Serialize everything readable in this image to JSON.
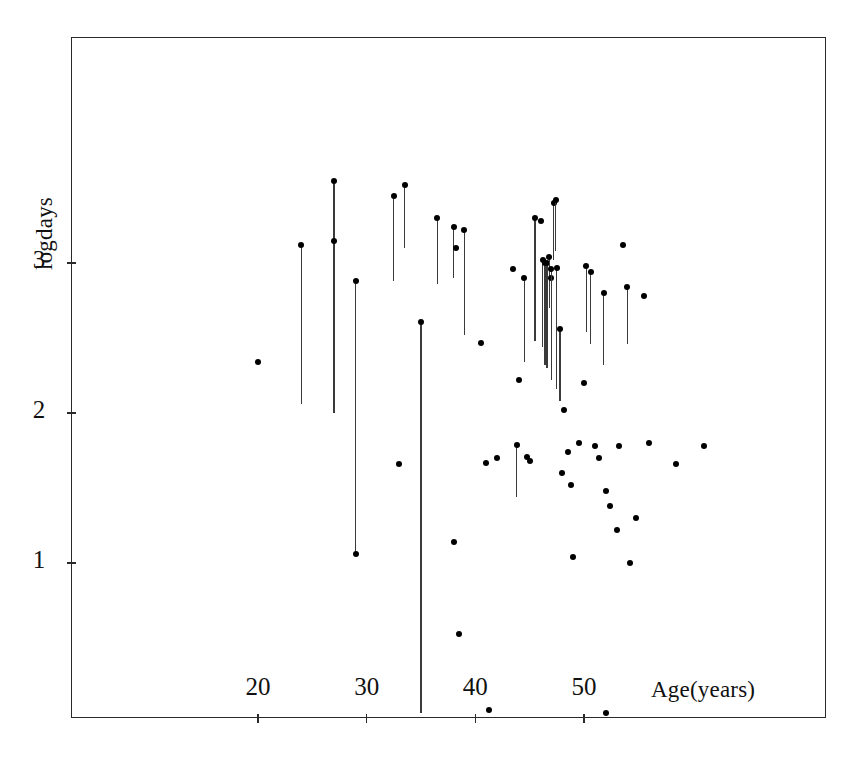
{
  "figure": {
    "kind": "scatter-with-dropline",
    "background": "#ffffff",
    "ink": "#111111"
  },
  "chart_data": {
    "type": "scatter",
    "title": "",
    "subtitle": "",
    "xlabel": "Age(years)",
    "ylabel": "logdays",
    "xlim": [
      15.1,
      84.4
    ],
    "ylim": [
      -0.03,
      4.54
    ],
    "grid": false,
    "legend": null,
    "annotations": [],
    "xticks": [
      20,
      30,
      40,
      50
    ],
    "xticklabels": [
      "20",
      "30",
      "40",
      "50"
    ],
    "yticks": [
      1,
      2,
      3
    ],
    "yticklabels": [
      "1",
      "2",
      "3"
    ],
    "marker": "filled-circle",
    "points": [
      {
        "x": 20.0,
        "y": 2.34
      },
      {
        "x": 24.0,
        "y": 3.12,
        "low": 2.06
      },
      {
        "x": 27.0,
        "y": 3.55,
        "low": 2.55
      },
      {
        "x": 27.0,
        "y": 3.15,
        "low": 2.0
      },
      {
        "x": 29.0,
        "y": 2.88,
        "low": 1.06,
        "low_dot": true
      },
      {
        "x": 32.5,
        "y": 3.45,
        "low": 2.88
      },
      {
        "x": 33.5,
        "y": 3.52,
        "low": 3.1
      },
      {
        "x": 33.0,
        "y": 1.66
      },
      {
        "x": 35.0,
        "y": 2.61,
        "low": 0.0
      },
      {
        "x": 36.5,
        "y": 3.3,
        "low": 2.86
      },
      {
        "x": 38.0,
        "y": 3.24,
        "low": 2.9
      },
      {
        "x": 39.0,
        "y": 3.22,
        "low": 2.52
      },
      {
        "x": 38.2,
        "y": 3.1
      },
      {
        "x": 38.0,
        "y": 1.14
      },
      {
        "x": 38.5,
        "y": 0.53
      },
      {
        "x": 40.5,
        "y": 2.47
      },
      {
        "x": 41.0,
        "y": 1.67
      },
      {
        "x": 41.3,
        "y": 0.02
      },
      {
        "x": 42.0,
        "y": 1.7
      },
      {
        "x": 43.5,
        "y": 2.96
      },
      {
        "x": 44.0,
        "y": 2.22
      },
      {
        "x": 43.8,
        "y": 1.79,
        "low": 1.44
      },
      {
        "x": 44.5,
        "y": 2.9,
        "low": 2.34
      },
      {
        "x": 44.8,
        "y": 1.71
      },
      {
        "x": 45.0,
        "y": 1.68
      },
      {
        "x": 45.5,
        "y": 3.3,
        "low": 2.48
      },
      {
        "x": 46.0,
        "y": 3.28
      },
      {
        "x": 46.2,
        "y": 3.02,
        "low": 2.44
      },
      {
        "x": 46.4,
        "y": 3.0,
        "low": 2.32
      },
      {
        "x": 46.6,
        "y": 3.0,
        "low": 2.3
      },
      {
        "x": 46.8,
        "y": 3.04,
        "low": 2.7
      },
      {
        "x": 47.0,
        "y": 2.9
      },
      {
        "x": 47.2,
        "y": 3.4,
        "low": 3.02
      },
      {
        "x": 47.4,
        "y": 3.42,
        "low": 3.08
      },
      {
        "x": 47.0,
        "y": 2.96,
        "low": 2.22
      },
      {
        "x": 47.5,
        "y": 2.97,
        "low": 2.16
      },
      {
        "x": 47.8,
        "y": 2.56,
        "low": 2.08
      },
      {
        "x": 48.2,
        "y": 2.02
      },
      {
        "x": 48.5,
        "y": 1.74
      },
      {
        "x": 48.0,
        "y": 1.6
      },
      {
        "x": 48.8,
        "y": 1.52
      },
      {
        "x": 49.0,
        "y": 1.04
      },
      {
        "x": 49.5,
        "y": 1.8
      },
      {
        "x": 50.2,
        "y": 2.98,
        "low": 2.54
      },
      {
        "x": 50.6,
        "y": 2.94,
        "low": 2.46
      },
      {
        "x": 50.0,
        "y": 2.2
      },
      {
        "x": 51.0,
        "y": 1.78
      },
      {
        "x": 51.4,
        "y": 1.7
      },
      {
        "x": 51.8,
        "y": 2.8,
        "low": 2.32
      },
      {
        "x": 52.0,
        "y": 1.48
      },
      {
        "x": 52.4,
        "y": 1.38
      },
      {
        "x": 53.0,
        "y": 1.22
      },
      {
        "x": 53.2,
        "y": 1.78
      },
      {
        "x": 53.6,
        "y": 3.12
      },
      {
        "x": 54.0,
        "y": 2.84,
        "low": 2.46
      },
      {
        "x": 54.2,
        "y": 1.0
      },
      {
        "x": 54.8,
        "y": 1.3
      },
      {
        "x": 55.5,
        "y": 2.78
      },
      {
        "x": 56.0,
        "y": 1.8
      },
      {
        "x": 58.5,
        "y": 1.66
      },
      {
        "x": 61.0,
        "y": 1.78
      },
      {
        "x": 52.0,
        "y": 0.0
      }
    ]
  },
  "axes": {
    "x_tick_values": [
      20,
      30,
      40,
      50
    ],
    "y_tick_values": [
      1,
      2,
      3
    ],
    "x_axis_title": "Age(years)",
    "y_axis_title": "logdays"
  },
  "geometry": {
    "frame": {
      "left": 71,
      "top": 37,
      "width": 755,
      "height": 681
    },
    "x_map": {
      "value_a": 20,
      "px_a": 258,
      "value_b": 50,
      "px_b": 584
    },
    "y_map": {
      "value_a": 1,
      "px_a": 563,
      "value_b": 3,
      "px_b": 263
    },
    "xlabel_pos": {
      "left": 651,
      "top": 677
    },
    "ylabel_pos": {
      "left": 32,
      "top": 197
    }
  }
}
